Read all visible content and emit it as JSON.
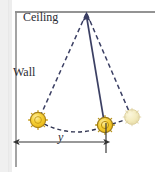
{
  "figure": {
    "type": "physics-diagram",
    "background_color": "#ffffff",
    "labels": {
      "ceiling": "Ceiling",
      "wall": "Wall",
      "distance": "y"
    },
    "colors": {
      "line_dark": "#3b3f63",
      "wall_gray": "#8a8a8a",
      "ceiling_gray": "#6f6f6f",
      "bob_fill": "#f5c518",
      "bob_fill_light": "#f7e07a",
      "bob_stroke": "#a8821a",
      "bob_ghost_fill": "#f2e7b0",
      "bob_ghost_stroke": "#d8c98a",
      "dimension_line": "#333333",
      "text": "#2b2b33"
    },
    "geometry": {
      "pivot": {
        "x": 86,
        "y": 13
      },
      "bob_left": {
        "x": 38,
        "y": 120,
        "r": 8
      },
      "bob_center": {
        "x": 105,
        "y": 125,
        "r": 8
      },
      "bob_right": {
        "x": 132,
        "y": 117,
        "r": 8
      },
      "ceiling_line": {
        "x1": 15,
        "y1": 12,
        "x2": 155,
        "y2": 12
      },
      "wall_line": {
        "x1": 16,
        "y1": 12,
        "x2": 16,
        "y2": 166
      },
      "dimension_arrow": {
        "x1": 17,
        "x2": 106,
        "y": 142
      },
      "tick_line": {
        "x": 106,
        "y1": 123,
        "y2": 152
      }
    },
    "elements": {
      "solid_rod_name": "pendulum-rod-equilibrium",
      "dashed_left_name": "pendulum-rod-left-extreme",
      "dashed_right_name": "pendulum-rod-right-extreme",
      "arc_name": "pendulum-swing-arc",
      "pivot_arrow_name": "pivot-arrowhead"
    }
  }
}
